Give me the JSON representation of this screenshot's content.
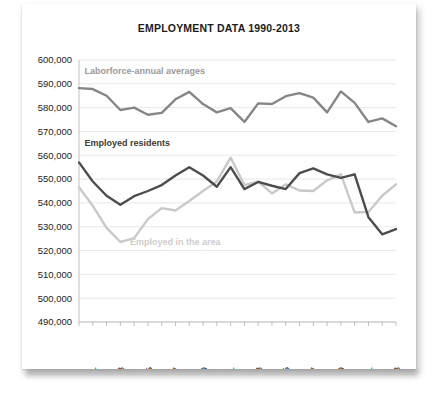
{
  "card": {
    "title": "EMPLOYMENT DATA 1990-2013"
  },
  "chart_data": {
    "type": "line",
    "title": "EMPLOYMENT DATA 1990-2013",
    "xlabel": "",
    "ylabel": "",
    "grid": true,
    "legend_position": "inline-annotations",
    "ylim": [
      490000,
      600000
    ],
    "ytick_step": 10000,
    "ytick_labels": [
      "600,000",
      "590,000",
      "580,000",
      "570,000",
      "560,000",
      "550,000",
      "540,000",
      "530,000",
      "520,000",
      "510,000",
      "500,000",
      "490,000"
    ],
    "ytick_values": [
      600000,
      590000,
      580000,
      570000,
      560000,
      550000,
      540000,
      530000,
      520000,
      510000,
      500000,
      490000
    ],
    "x": [
      1990,
      1991,
      1992,
      1993,
      1994,
      1995,
      1996,
      1997,
      1998,
      1999,
      2000,
      2001,
      2002,
      2003,
      2004,
      2005,
      2006,
      2007,
      2008,
      2009,
      2010,
      2011,
      2012,
      2013
    ],
    "xtick_labels": [
      "1991",
      "1993",
      "1995",
      "1997",
      "1999",
      "2001",
      "2003",
      "2005",
      "2007",
      "2009",
      "2011",
      "2013"
    ],
    "xtick_values": [
      1991,
      1993,
      1995,
      1997,
      1999,
      2001,
      2003,
      2005,
      2007,
      2009,
      2011,
      2013
    ],
    "series": [
      {
        "name": "Laborforce-annual averages",
        "color": "#868686",
        "label_color": "#9a9a9a",
        "values": [
          588200,
          587800,
          585000,
          579000,
          580000,
          577000,
          577800,
          583500,
          586600,
          581500,
          578000,
          579800,
          574000,
          581800,
          581500,
          584800,
          586100,
          584200,
          578000,
          586800,
          582000,
          574000,
          575500,
          572200
        ]
      },
      {
        "name": "Employed residents",
        "color": "#4d4d4d",
        "label_color": "#3b3b3b",
        "values": [
          557000,
          549000,
          543000,
          539200,
          542800,
          545000,
          547500,
          551500,
          555000,
          551500,
          546800,
          555000,
          545800,
          548800,
          547200,
          545800,
          552500,
          554500,
          552000,
          550500,
          552000,
          534000,
          529200,
          526500
        ]
      },
      {
        "name": "Employed in the area",
        "color": "#c9c9c9",
        "label_color": "#cdcdcd",
        "values": [
          546600,
          538800,
          529500,
          523600,
          525200,
          533200,
          537800,
          536800,
          540800,
          545000,
          549000,
          559000,
          547500,
          549000,
          544000,
          547800,
          545200,
          545000,
          549500,
          552000,
          536000,
          536200,
          543000,
          547800
        ]
      }
    ],
    "annotations": [
      {
        "text": "Laborforce-annual averages",
        "x": 1990.4,
        "y": 594000,
        "color": "#9a9a9a"
      },
      {
        "text": "Employed residents",
        "x": 1990.4,
        "y": 563800,
        "color": "#3b3b3b"
      },
      {
        "text": "Employed in the area",
        "x": 1993.7,
        "y": 522500,
        "color": "#cdcdcd"
      }
    ],
    "series_override_tail": {
      "note": "final two points of employed residents rise slightly",
      "Employed residents": {
        "2012": 526800,
        "2013": 529000
      }
    }
  }
}
